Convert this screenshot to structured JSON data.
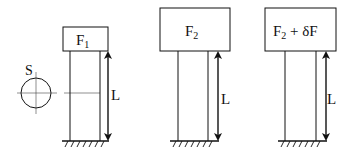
{
  "diagram": {
    "panels": [
      {
        "id": "panel-1",
        "load_label": "F",
        "load_subscript": "1",
        "load_suffix": "",
        "length_label": "L"
      },
      {
        "id": "panel-2",
        "load_label": "F",
        "load_subscript": "2",
        "load_suffix": "",
        "length_label": "L"
      },
      {
        "id": "panel-3",
        "load_label": "F",
        "load_subscript": "2",
        "load_suffix": " + δF",
        "length_label": "L"
      }
    ],
    "cross_section": {
      "label": "S"
    }
  },
  "colors": {
    "stroke": "#111111",
    "background": "#ffffff"
  }
}
